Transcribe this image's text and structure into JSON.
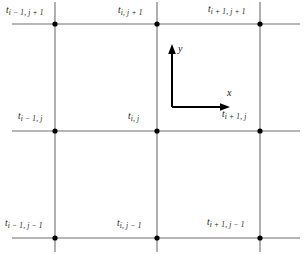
{
  "figure": {
    "type": "finite-difference-grid-diagram",
    "background_color": "#ffffff",
    "gridline_color": "#6e6e6e",
    "node_color": "#000000",
    "axis_color": "#000000",
    "text_color": "#141414"
  },
  "axes_indicator": {
    "x_label": "x",
    "y_label": "y",
    "origin": {
      "x": 172,
      "y": 107
    },
    "x_arrow_end": {
      "x": 228,
      "y": 107
    },
    "y_arrow_end": {
      "x": 172,
      "y": 47
    }
  },
  "grid": {
    "vertical_lines_x": [
      55,
      157,
      260
    ],
    "horizontal_lines_y": [
      24,
      131,
      238
    ],
    "vertical_extent": {
      "top": 2,
      "bottom": 252
    },
    "horizontal_extent": {
      "left": 12,
      "right": 300
    }
  },
  "nodes": [
    {
      "id": "node-im1-jp1",
      "base": "t",
      "sub": "i − 1, j + 1",
      "x": 55,
      "y": 24,
      "label_x": 6,
      "label_y": 6
    },
    {
      "id": "node-i-jp1",
      "base": "t",
      "sub": "i, j + 1",
      "x": 157,
      "y": 24,
      "label_x": 118,
      "label_y": 6
    },
    {
      "id": "node-ip1-jp1",
      "base": "t",
      "sub": "i + 1, j + 1",
      "x": 260,
      "y": 24,
      "label_x": 208,
      "label_y": 5
    },
    {
      "id": "node-im1-j",
      "base": "t",
      "sub": "i − 1, j",
      "x": 55,
      "y": 131,
      "label_x": 18,
      "label_y": 112
    },
    {
      "id": "node-i-j",
      "base": "t",
      "sub": "i, j",
      "x": 157,
      "y": 131,
      "label_x": 128,
      "label_y": 112
    },
    {
      "id": "node-ip1-j",
      "base": "t",
      "sub": "i + 1, j",
      "x": 260,
      "y": 131,
      "label_x": 222,
      "label_y": 110
    },
    {
      "id": "node-im1-jm1",
      "base": "t",
      "sub": "i − 1, j − 1",
      "x": 55,
      "y": 238,
      "label_x": 5,
      "label_y": 219
    },
    {
      "id": "node-i-jm1",
      "base": "t",
      "sub": "i, j − 1",
      "x": 157,
      "y": 238,
      "label_x": 117,
      "label_y": 219
    },
    {
      "id": "node-ip1-jm1",
      "base": "t",
      "sub": "i + 1, j − 1",
      "x": 260,
      "y": 238,
      "label_x": 207,
      "label_y": 218
    }
  ]
}
